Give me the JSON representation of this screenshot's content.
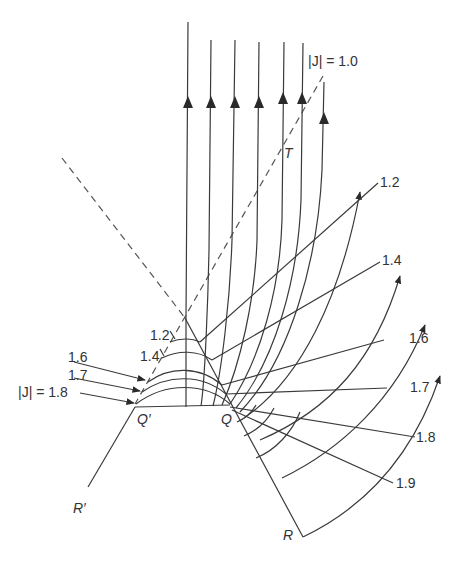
{
  "figure": {
    "labels": {
      "J10": "|J| = 1.0",
      "T": "T",
      "Qp": "Q′",
      "Q": "Q",
      "Rp": "R′",
      "R": "R",
      "right_1_2": "1.2",
      "right_1_4": "1.4",
      "right_1_6": "1.6",
      "right_1_7": "1.7",
      "right_1_8": "1.8",
      "right_1_9": "1.9",
      "left_1_2": "1.2",
      "left_1_4": "1.4",
      "left_1_6": "1.6",
      "left_1_7": "1.7",
      "left_J18": "|J| = 1.8"
    }
  }
}
